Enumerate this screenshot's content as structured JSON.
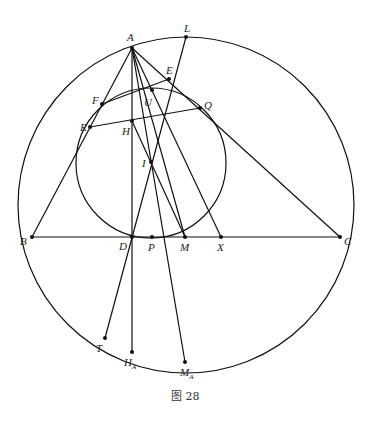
{
  "figure": {
    "caption": "图 28",
    "circumcircle": {
      "cx": 186,
      "cy": 205,
      "r": 168
    },
    "incircle": {
      "cx": 151,
      "cy": 163,
      "r": 75
    },
    "points": {
      "A": {
        "label": "A",
        "x": 132,
        "y": 48
      },
      "L": {
        "label": "L",
        "x": 186,
        "y": 37
      },
      "E": {
        "label": "E",
        "x": 169,
        "y": 79
      },
      "F": {
        "label": "F",
        "x": 102,
        "y": 104
      },
      "U": {
        "label": "U",
        "x": 152,
        "y": 90
      },
      "Q": {
        "label": "Q",
        "x": 200,
        "y": 108
      },
      "R": {
        "label": "R",
        "x": 90,
        "y": 127
      },
      "H": {
        "label": "H",
        "x": 132,
        "y": 121
      },
      "I": {
        "label": "I",
        "x": 151,
        "y": 162
      },
      "B": {
        "label": "B",
        "x": 32,
        "y": 237
      },
      "D": {
        "label": "D",
        "x": 132,
        "y": 237
      },
      "P": {
        "label": "P",
        "x": 152,
        "y": 237
      },
      "M": {
        "label": "M",
        "x": 185,
        "y": 237
      },
      "X": {
        "label": "X",
        "x": 221,
        "y": 237
      },
      "C": {
        "label": "C",
        "x": 340,
        "y": 237
      },
      "T": {
        "label": "T",
        "x": 105,
        "y": 338
      },
      "HA": {
        "label": "H",
        "sub": "A",
        "x": 132,
        "y": 352
      },
      "MA": {
        "label": "M",
        "sub": "A",
        "x": 185,
        "y": 362
      }
    }
  }
}
